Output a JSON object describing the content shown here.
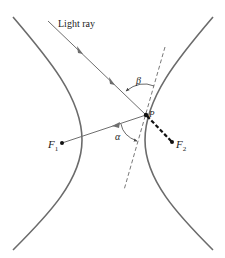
{
  "figure": {
    "labels": {
      "light_ray": "Light ray",
      "point": "P",
      "focus1": "F",
      "focus1_sub": "1",
      "focus2": "F",
      "focus2_sub": "2",
      "angle_alpha": "α",
      "angle_beta": "β"
    },
    "colors": {
      "curve": "#6b6b6b",
      "ray": "#6e6e6e",
      "focal_segment": "#111111",
      "text": "#222222",
      "background": "#ffffff"
    },
    "elements": [
      "left hyperbola branch",
      "right hyperbola branch",
      "incoming light ray toward P",
      "reflected ray from P toward F1",
      "dashed tangent line at P",
      "dashed segment P to F2",
      "angle alpha arc",
      "angle beta arc"
    ]
  }
}
